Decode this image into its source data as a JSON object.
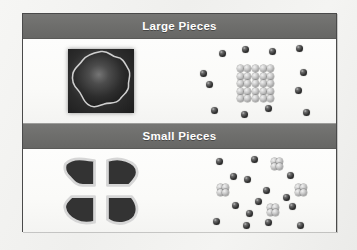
{
  "figure": {
    "frame": {
      "border_color": "#4a4a4a",
      "background_color": "#fbfbfa",
      "page_background_color": "#f2f2f0"
    },
    "band_color": "#6d6d6b",
    "band_text_color": "#ffffff",
    "sphere_dark_color": "#2e2e2e",
    "sphere_light_color": "#c9c9c9",
    "solid_color": "#2c2c2c",
    "sections": [
      {
        "id": "large-pieces",
        "label": "Large Pieces",
        "left_illustration": {
          "name": "single-large-solid-blob",
          "piece_count": 1,
          "description": "One large irregular dark solid chunk"
        },
        "right_illustration": {
          "name": "ordered-particle-grid-with-free-particles",
          "grid_columns": 5,
          "grid_rows": 5,
          "grid_particle_count": 25,
          "free_particle_count": 12,
          "description": "A compact 5 by 5 block of light particles surrounded by 12 dark free particles"
        }
      },
      {
        "id": "small-pieces",
        "label": "Small Pieces",
        "left_illustration": {
          "name": "quartered-solid-blob",
          "piece_count": 4,
          "description": "The same chunk cut into four smaller pieces with gaps between them"
        },
        "right_illustration": {
          "name": "scattered-particle-clusters-with-free-particles",
          "cluster_count": 4,
          "particles_per_cluster": 4,
          "clustered_particle_count": 16,
          "free_particle_count": 15,
          "description": "Four small light particle clusters dispersed among 15 dark free particles"
        }
      }
    ]
  }
}
